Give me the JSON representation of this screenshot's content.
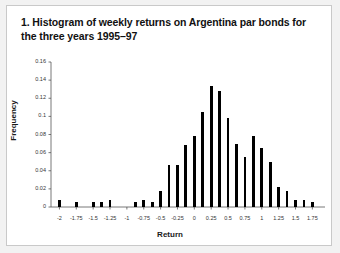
{
  "caption": {
    "text": "1. Histogram of weekly returns on Argentina par bonds for the three years 1995–97"
  },
  "colors": {
    "bar": "#000000",
    "axis": "#555555",
    "frame": "#c9c9c9",
    "panel": "#ffffff",
    "page": "#f2f2f2"
  },
  "chart_data": {
    "type": "bar",
    "title": "1. Histogram of weekly returns on Argentina par bonds for the three years 1995–97",
    "xlabel": "Return",
    "ylabel": "Frequency",
    "xlim": [
      -2.125,
      1.9375
    ],
    "ylim": [
      0,
      0.16
    ],
    "grid": false,
    "legend": null,
    "ytick_labels": [
      "0.16",
      "0.14",
      "0.12",
      "0.1",
      "0.08",
      "0.06",
      "0.04",
      "0.02",
      "0"
    ],
    "ytick_values": [
      0.16,
      0.14,
      0.12,
      0.1,
      0.08,
      0.06,
      0.04,
      0.02,
      0
    ],
    "xtick_labels": [
      "-2",
      "-1.75",
      "-1.5",
      "-1.25",
      "-1",
      "-0.75",
      "-0.5",
      "-0.25",
      "0",
      "0.25",
      "0.5",
      "0.75",
      "1",
      "1.25",
      "1.5",
      "1.75"
    ],
    "xtick_values": [
      -2,
      -1.75,
      -1.5,
      -1.25,
      -1,
      -0.75,
      -0.5,
      -0.25,
      0,
      0.25,
      0.5,
      0.75,
      1,
      1.25,
      1.5,
      1.75
    ],
    "bin_width": 0.0625,
    "x": [
      -2.0,
      -1.9375,
      -1.875,
      -1.8125,
      -1.75,
      -1.6875,
      -1.625,
      -1.5625,
      -1.5,
      -1.4375,
      -1.375,
      -1.3125,
      -1.25,
      -1.1875,
      -1.125,
      -1.0625,
      -1.0,
      -0.9375,
      -0.875,
      -0.8125,
      -0.75,
      -0.6875,
      -0.625,
      -0.5625,
      -0.5,
      -0.4375,
      -0.375,
      -0.3125,
      -0.25,
      -0.1875,
      -0.125,
      -0.0625,
      0.0,
      0.0625,
      0.125,
      0.1875,
      0.25,
      0.3125,
      0.375,
      0.4375,
      0.5,
      0.5625,
      0.625,
      0.6875,
      0.75,
      0.8125,
      0.875,
      0.9375,
      1.0,
      1.0625,
      1.125,
      1.1875,
      1.25,
      1.3125,
      1.375,
      1.4375,
      1.5,
      1.5625,
      1.625,
      1.6875,
      1.75,
      1.8125,
      1.875
    ],
    "values": [
      0.008,
      0.0,
      0.0,
      0.0,
      0.005,
      0.0,
      0.0,
      0.0,
      0.005,
      0.0,
      0.005,
      0.0,
      0.008,
      0.0,
      0.0,
      0.0,
      0.0,
      0.0,
      0.005,
      0.0,
      0.008,
      0.0,
      0.005,
      0.0,
      0.018,
      0.0,
      0.046,
      0.0,
      0.046,
      0.0,
      0.068,
      0.0,
      0.078,
      0.0,
      0.105,
      0.0,
      0.134,
      0.0,
      0.128,
      0.0,
      0.098,
      0.0,
      0.07,
      0.0,
      0.055,
      0.0,
      0.078,
      0.0,
      0.065,
      0.0,
      0.05,
      0.0,
      0.022,
      0.0,
      0.018,
      0.0,
      0.008,
      0.0,
      0.008,
      0.0,
      0.006,
      0.0,
      0.0
    ]
  }
}
